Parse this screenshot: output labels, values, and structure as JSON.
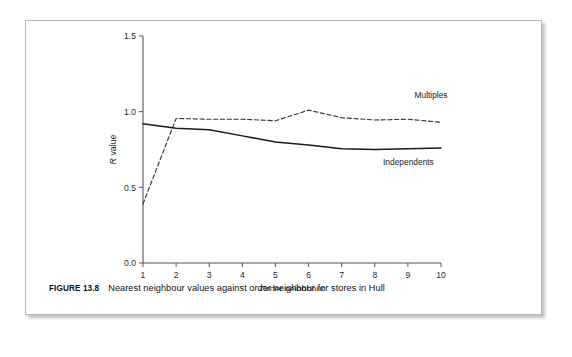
{
  "figure": {
    "caption_number": "FIGURE 13.8",
    "caption_text": "Nearest neighbour values against order neighbour for stores in Hull"
  },
  "chart_data": {
    "type": "line",
    "title": "",
    "subtitle": "",
    "xlabel": "Order neighbour",
    "ylabel": "R value",
    "x": [
      1,
      2,
      3,
      4,
      5,
      6,
      7,
      8,
      9,
      10
    ],
    "xticklabels": [
      "1",
      "2",
      "3",
      "4",
      "5",
      "6",
      "7",
      "8",
      "9",
      "10"
    ],
    "yticklabels": [
      "0.0",
      "0.5",
      "1.0",
      "1.5"
    ],
    "yticks": [
      0.0,
      0.5,
      1.0,
      1.5
    ],
    "xlim": [
      1,
      10
    ],
    "ylim": [
      0.0,
      1.5
    ],
    "grid": false,
    "legend_position": "inline-right",
    "series": [
      {
        "name": "Multiples",
        "style": "dashed",
        "color": "#333333",
        "values": [
          0.39,
          0.955,
          0.95,
          0.95,
          0.94,
          1.01,
          0.96,
          0.945,
          0.95,
          0.93
        ],
        "label_x": 9.2,
        "label_y": 1.09
      },
      {
        "name": "Independents",
        "style": "solid",
        "color": "#1a1a1a",
        "values": [
          0.92,
          0.89,
          0.88,
          0.84,
          0.8,
          0.78,
          0.755,
          0.75,
          0.755,
          0.76
        ],
        "label_x": 8.25,
        "label_y": 0.645
      }
    ]
  },
  "colors": {
    "frame_border": "#b9b9b9",
    "axis": "#555555",
    "text": "#1a1a1a",
    "background": "#ffffff"
  }
}
